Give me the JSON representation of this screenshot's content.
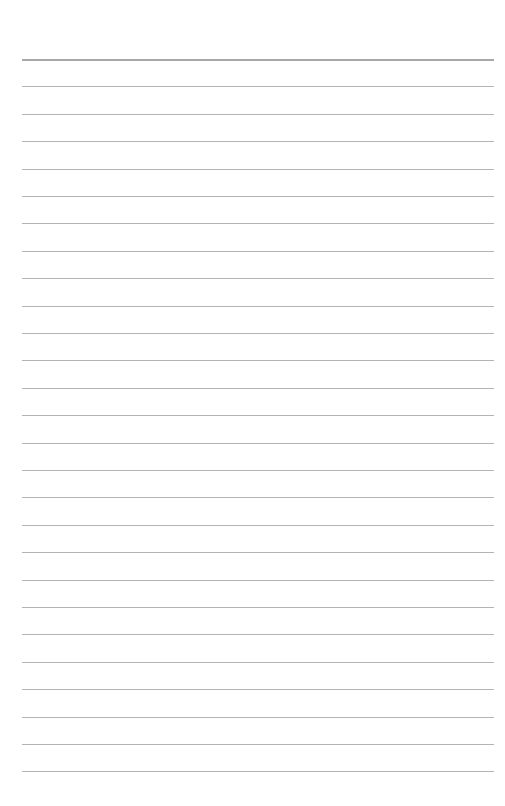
{
  "page": {
    "type": "lined-paper",
    "line_count": 27,
    "first_line_y": 59,
    "line_spacing": 27.4,
    "line_left": 22,
    "line_right": 494,
    "line_color": "#b4b4b4",
    "background_color": "#ffffff"
  }
}
